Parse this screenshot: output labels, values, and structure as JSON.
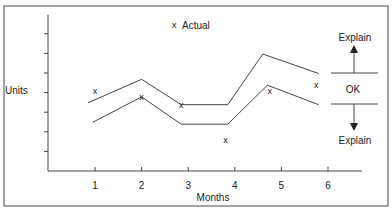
{
  "chart_data": {
    "type": "line",
    "title": "",
    "xlabel": "Months",
    "ylabel": "Units",
    "x_ticks": [
      "1",
      "2",
      "3",
      "4",
      "5",
      "6"
    ],
    "y_ticks_count": 7,
    "y_tick_labels": [],
    "ylim": [
      0,
      8
    ],
    "xlim": [
      0.5,
      6.7
    ],
    "grid": false,
    "legend": {
      "position": "top-center",
      "entries": [
        {
          "marker": "x",
          "label": "Actual"
        }
      ]
    },
    "series": [
      {
        "name": "Actual",
        "kind": "scatter",
        "marker": "x",
        "x": [
          1,
          2,
          2.85,
          3.8,
          4.75,
          5.75
        ],
        "values": [
          4.1,
          3.8,
          3.4,
          1.6,
          4.1,
          4.4
        ]
      },
      {
        "name": "Upper control limit",
        "kind": "line",
        "x": [
          0.85,
          2,
          2.85,
          3.85,
          4.6,
          5.8
        ],
        "values": [
          3.5,
          4.7,
          3.4,
          3.4,
          6.0,
          5.0
        ]
      },
      {
        "name": "Lower control limit",
        "kind": "line",
        "x": [
          0.95,
          2,
          2.85,
          3.85,
          4.7,
          5.8
        ],
        "values": [
          2.5,
          3.8,
          2.4,
          2.4,
          4.4,
          3.4
        ]
      }
    ],
    "annotations": [
      {
        "text": "OK",
        "meaning": "within band"
      },
      {
        "text": "Explain",
        "meaning": "above upper limit",
        "arrow": "up"
      },
      {
        "text": "Explain",
        "meaning": "below lower limit",
        "arrow": "down"
      }
    ]
  },
  "labels": {
    "ylabel": "Units",
    "xlabel": "Months",
    "legend_marker": "x",
    "legend_text": "Actual",
    "ok": "OK",
    "explain_upper": "Explain",
    "explain_lower": "Explain",
    "x_ticks": [
      "1",
      "2",
      "3",
      "4",
      "5",
      "6"
    ],
    "point_marker": "x"
  },
  "colors": {
    "line": "#444444",
    "text": "#222222",
    "frame": "#666666"
  }
}
